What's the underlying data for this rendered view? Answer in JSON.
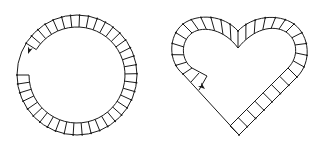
{
  "figure": {
    "background": "#ffffff",
    "stroke_color": "#1a1a1a",
    "shapes": [
      {
        "name": "circular-track",
        "kind": "ring",
        "center": [
          77,
          75
        ],
        "outer_radius": 60,
        "inner_radius": 48,
        "segment_count": 38,
        "gap_start_deg": 148,
        "gap_end_deg": 180,
        "arrow": {
          "at": [
            28,
            52
          ],
          "direction_deg": 115
        }
      },
      {
        "name": "heart-track",
        "kind": "heart",
        "outer_tip": [
          239,
          135
        ],
        "notch_outer": [
          238,
          30
        ],
        "notch_inner": [
          238,
          48
        ],
        "left_extent": 173,
        "right_extent": 307,
        "top": 17,
        "segment_count_visible": 34,
        "arrow": {
          "at": [
            203,
            88
          ],
          "direction_deg": 45
        }
      }
    ]
  }
}
